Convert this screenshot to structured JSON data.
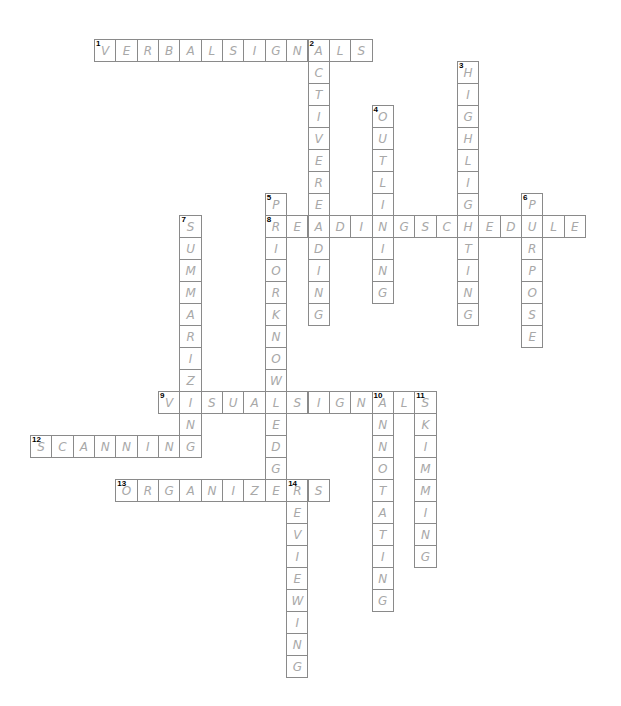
{
  "puzzle": {
    "type": "crossword",
    "grid": {
      "origin_x": 94,
      "origin_y": 38.5,
      "col_pitch": 21.35,
      "row_pitch": 22,
      "colors": {
        "border": "#8a8a8a",
        "letter": "#a8a8a8",
        "number": "#000000",
        "background": "#ffffff"
      }
    },
    "entries": [
      {
        "number": "1",
        "direction": "across",
        "answer": "VERBALSIGNALS",
        "row": 0,
        "col": 0
      },
      {
        "number": "2",
        "direction": "down",
        "answer": "ACTIVEREADING",
        "row": 0,
        "col": 10
      },
      {
        "number": "3",
        "direction": "down",
        "answer": "HIGHLIGHTING",
        "row": 1,
        "col": 17
      },
      {
        "number": "4",
        "direction": "down",
        "answer": "OUTLINING",
        "row": 3,
        "col": 13
      },
      {
        "number": "5",
        "direction": "down",
        "answer": "PRIORKNOWLEDGE",
        "row": 7,
        "col": 8
      },
      {
        "number": "6",
        "direction": "down",
        "answer": "PURPOSE",
        "row": 7,
        "col": 20
      },
      {
        "number": "7",
        "direction": "down",
        "answer": "SUMMARIZING",
        "row": 8,
        "col": 4
      },
      {
        "number": "8",
        "direction": "across",
        "answer": "READINGSCHEDULE",
        "row": 8,
        "col": 8
      },
      {
        "number": "9",
        "direction": "across",
        "answer": "VISUALSIGNALS",
        "row": 16,
        "col": 3
      },
      {
        "number": "10",
        "direction": "down",
        "answer": "ANNOTATING",
        "row": 16,
        "col": 13
      },
      {
        "number": "11",
        "direction": "down",
        "answer": "SKIMMING",
        "row": 16,
        "col": 15
      },
      {
        "number": "12",
        "direction": "across",
        "answer": "SCANNING",
        "row": 18,
        "col": -3
      },
      {
        "number": "13",
        "direction": "across",
        "answer": "ORGANIZERS",
        "row": 20,
        "col": 1
      },
      {
        "number": "14",
        "direction": "down",
        "answer": "REVIEWING",
        "row": 20,
        "col": 9
      }
    ]
  }
}
